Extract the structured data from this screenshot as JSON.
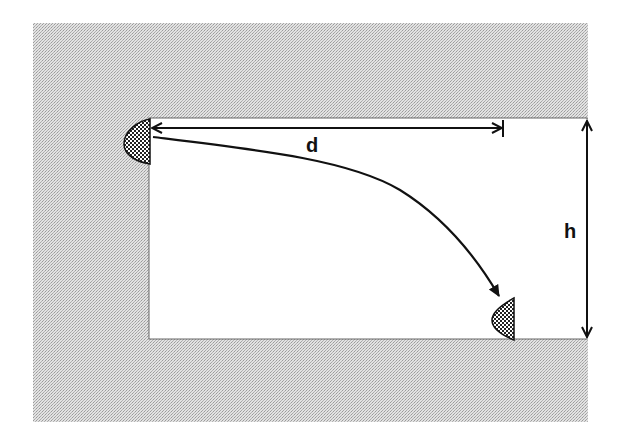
{
  "diagram": {
    "type": "projectile-trajectory",
    "labels": {
      "horizontal_distance": "d",
      "height": "h"
    },
    "objects": {
      "launch_blob": "hatched-half-drop",
      "landing_blob": "hatched-half-drop"
    },
    "colors": {
      "background_texture": "#c8c8c8",
      "panel": "#ffffff",
      "ink": "#111111"
    }
  }
}
